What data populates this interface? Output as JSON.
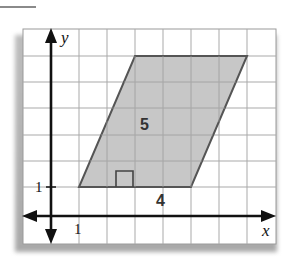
{
  "diagram": {
    "type": "coordinate-grid-parallelogram",
    "axes": {
      "x_label": "x",
      "y_label": "y"
    },
    "ticks": {
      "x_tick_label": "1",
      "y_tick_label": "1"
    },
    "dimensions": {
      "height_label": "5",
      "base_label": "4"
    },
    "shape": {
      "name": "parallelogram",
      "vertices_grid": [
        [
          1,
          1
        ],
        [
          5,
          1
        ],
        [
          7,
          6
        ],
        [
          3,
          6
        ]
      ],
      "fill_color": "#c4c4c4",
      "stroke_color": "#555555"
    },
    "right_angle_marker": true,
    "grid_color": "#a9a9a9",
    "axis_color": "#111111"
  }
}
